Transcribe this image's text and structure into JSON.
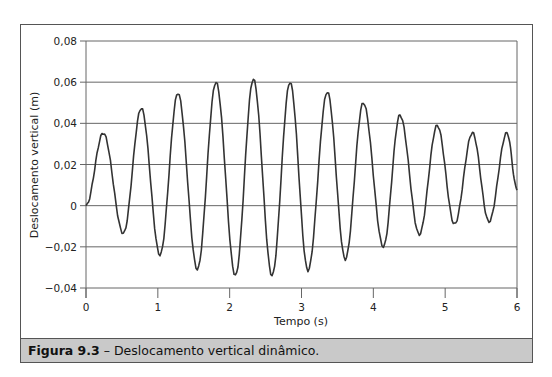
{
  "figure": {
    "caption_label": "Figura 9.3",
    "caption_text": " – Deslocamento vertical dinâmico."
  },
  "chart_data": {
    "type": "line",
    "title": "",
    "xlabel": "Tempo (s)",
    "ylabel": "Deslocamento vertical (m)",
    "xlim": [
      0,
      6
    ],
    "ylim": [
      -0.04,
      0.08
    ],
    "x_ticks": [
      0,
      1,
      2,
      3,
      4,
      5,
      6
    ],
    "x_tick_labels": [
      "0",
      "1",
      "2",
      "3",
      "4",
      "5",
      "6"
    ],
    "y_ticks": [
      -0.04,
      -0.02,
      0,
      0.02,
      0.04,
      0.06,
      0.08
    ],
    "y_tick_labels": [
      "−0,04",
      "−0,02",
      "0",
      "0,02",
      "0,04",
      "0,06",
      "0,08"
    ],
    "grid": {
      "horizontal": true,
      "vertical": false
    },
    "legend": null,
    "series": [
      {
        "name": "Deslocamento vertical",
        "color": "#333333",
        "extrema": [
          {
            "t": 0.0,
            "y": 0.0
          },
          {
            "t": 0.24,
            "y": 0.0353
          },
          {
            "t": 0.52,
            "y": -0.0135
          },
          {
            "t": 0.77,
            "y": 0.0474
          },
          {
            "t": 1.03,
            "y": -0.024
          },
          {
            "t": 1.28,
            "y": 0.0547
          },
          {
            "t": 1.55,
            "y": -0.031
          },
          {
            "t": 1.81,
            "y": 0.06
          },
          {
            "t": 2.08,
            "y": -0.034
          },
          {
            "t": 2.33,
            "y": 0.0615
          },
          {
            "t": 2.59,
            "y": -0.034
          },
          {
            "t": 2.84,
            "y": 0.06
          },
          {
            "t": 3.09,
            "y": -0.0315
          },
          {
            "t": 3.36,
            "y": 0.0553
          },
          {
            "t": 3.61,
            "y": -0.026
          },
          {
            "t": 3.86,
            "y": 0.05
          },
          {
            "t": 4.14,
            "y": -0.02
          },
          {
            "t": 4.37,
            "y": 0.044
          },
          {
            "t": 4.64,
            "y": -0.014
          },
          {
            "t": 4.89,
            "y": 0.039
          },
          {
            "t": 5.13,
            "y": -0.009
          },
          {
            "t": 5.38,
            "y": 0.0354
          },
          {
            "t": 5.61,
            "y": -0.0078
          },
          {
            "t": 5.86,
            "y": 0.0354
          },
          {
            "t": 6.0,
            "y": 0.008
          }
        ]
      }
    ]
  }
}
